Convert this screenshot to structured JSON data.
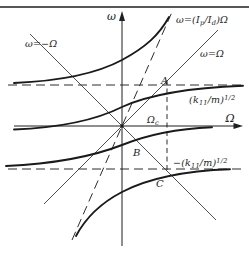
{
  "figure": {
    "ink_color": "#1f1f1f",
    "thin_line_color": "#3c3c3c",
    "background": "#ffffff"
  },
  "axes": {
    "y_axis_label": "ω",
    "x_axis_label": "Ω"
  },
  "lines": {
    "gyro_asymptote_label": {
      "pre": "ω=(I",
      "sub1": "p",
      "mid": "/I",
      "sub2": "d",
      "post": ")Ω"
    },
    "backward_line_label": "ω=−Ω",
    "forward_line_label": "ω=Ω",
    "upper_asymptote_label": {
      "pre": "(k",
      "sub": "11",
      "mid": "/m)",
      "sup": "1/2"
    },
    "lower_asymptote_label": {
      "pre": "−(k",
      "sub": "11",
      "mid": "/m)",
      "sup": "1/2"
    }
  },
  "markers": {
    "critical_speed_label": {
      "base": "Ω",
      "sub": "c"
    },
    "point_a_label": "A",
    "point_b_label": "B",
    "point_c_label": "C"
  }
}
